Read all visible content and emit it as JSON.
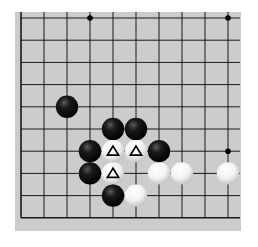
{
  "board": {
    "background": "#cccccc",
    "line_color": "#1a1a1a",
    "columns": 10,
    "rows": 10,
    "visible_edges": [
      "left",
      "bottom"
    ],
    "origin_px": {
      "x": 21,
      "y": 18
    },
    "spacing_px": {
      "x": 23,
      "y": 22.2
    },
    "star_points": [
      {
        "col": 3,
        "row": 0
      },
      {
        "col": 9,
        "row": 0
      },
      {
        "col": 9,
        "row": 6
      }
    ],
    "stones": [
      {
        "color": "black",
        "col": 2,
        "row": 4,
        "marker": ""
      },
      {
        "color": "black",
        "col": 4,
        "row": 5,
        "marker": ""
      },
      {
        "color": "black",
        "col": 5,
        "row": 5,
        "marker": ""
      },
      {
        "color": "black",
        "col": 3,
        "row": 6,
        "marker": ""
      },
      {
        "color": "white",
        "col": 4,
        "row": 6,
        "marker": "triangle"
      },
      {
        "color": "white",
        "col": 5,
        "row": 6,
        "marker": "triangle"
      },
      {
        "color": "black",
        "col": 6,
        "row": 6,
        "marker": ""
      },
      {
        "color": "black",
        "col": 3,
        "row": 7,
        "marker": ""
      },
      {
        "color": "white",
        "col": 4,
        "row": 7,
        "marker": "triangle"
      },
      {
        "color": "white",
        "col": 6,
        "row": 7,
        "marker": ""
      },
      {
        "color": "white",
        "col": 7,
        "row": 7,
        "marker": ""
      },
      {
        "color": "white",
        "col": 9,
        "row": 7,
        "marker": ""
      },
      {
        "color": "black",
        "col": 4,
        "row": 8,
        "marker": ""
      },
      {
        "color": "white",
        "col": 5,
        "row": 8,
        "marker": ""
      }
    ]
  }
}
